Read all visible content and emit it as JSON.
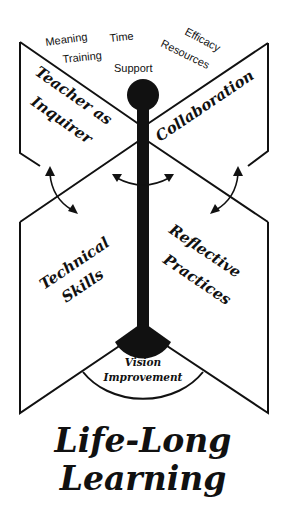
{
  "diagram": {
    "title_line1": "Life-Long",
    "title_line2": "Learning",
    "top_labels": {
      "meaning": "Meaning",
      "training": "Training",
      "time": "Time",
      "support": "Support",
      "efficacy": "Efficacy",
      "resources": "Resources"
    },
    "panels": {
      "top_left_line1": "Teacher as",
      "top_left_line2": "Inquirer",
      "top_right": "Collaboration",
      "bottom_left_line1": "Technical",
      "bottom_left_line2": "Skills",
      "bottom_right_line1": "Reflective",
      "bottom_right_line2": "Practices"
    },
    "fan": {
      "line1": "Vision",
      "line2": "Improvement"
    },
    "colors": {
      "ink": "#111111",
      "background": "#ffffff"
    }
  }
}
